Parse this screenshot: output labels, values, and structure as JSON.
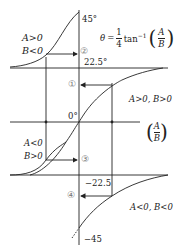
{
  "diagram": {
    "type": "phase-determination-diagram",
    "formula": {
      "lhs": "θ",
      "eq": "=",
      "coef_num": "1",
      "coef_den": "4",
      "func": "tan",
      "exp": "−1",
      "arg_num": "A",
      "arg_den": "B"
    },
    "axis_label": {
      "num": "A",
      "den": "B"
    },
    "tick_labels": {
      "top": "45°",
      "upper_mid": "22.5°",
      "zero": "0°",
      "lower_mid": "−22.5",
      "bottom": "−45"
    },
    "markers": [
      "②",
      "①",
      "③",
      "④"
    ],
    "regions": {
      "top_left": [
        "A>0",
        "B<0"
      ],
      "right_upper": "A>0, B>0",
      "left_lower": [
        "A<0",
        "B>0"
      ],
      "right_lower": "A<0,  B<0"
    },
    "colors": {
      "line": "#222222",
      "background": "#ffffff"
    }
  }
}
